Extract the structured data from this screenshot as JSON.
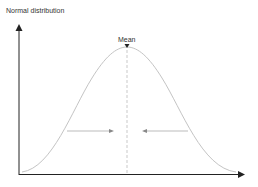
{
  "title": "Normal distribution",
  "annotations": {
    "mean_label": "Mean"
  },
  "colors": {
    "axis": "#222222",
    "curve": "#bdbdbd",
    "mean_line": "#bdbdbd",
    "arrows": "#9e9e9e"
  }
}
